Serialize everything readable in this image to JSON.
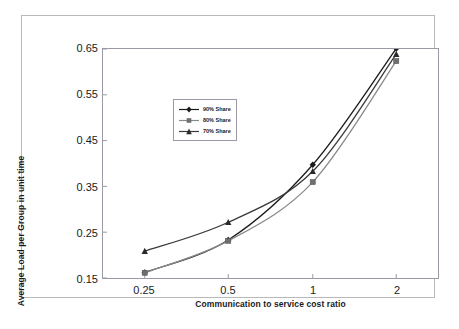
{
  "chart_data": {
    "type": "line",
    "title": "",
    "xlabel": "Communication to service cost ratio",
    "ylabel": "Average Load per Group in unit time",
    "categories": [
      "0.25",
      "0.5",
      "1",
      "2"
    ],
    "x_tick_labels": [
      "0.25",
      "0.5",
      "1",
      "2"
    ],
    "y_tick_labels": [
      "0.15",
      "0.25",
      "0.35",
      "0.45",
      "0.55",
      "0.65"
    ],
    "ylim": [
      0.15,
      0.68
    ],
    "grid": false,
    "legend_position": "upper-left-inside",
    "series": [
      {
        "name": "90% Share",
        "marker": "diamond",
        "color": "#1a1a1a",
        "values": [
          0.163,
          0.238,
          0.412,
          0.681
        ]
      },
      {
        "name": "80% Share",
        "marker": "square",
        "color": "#8a8a8a",
        "values": [
          0.162,
          0.236,
          0.372,
          0.652
        ]
      },
      {
        "name": "70% Share",
        "marker": "triangle",
        "color": "#3a3a3a",
        "values": [
          0.212,
          0.279,
          0.397,
          0.668
        ]
      }
    ]
  },
  "legend": {
    "entries": [
      {
        "label": "90% Share"
      },
      {
        "label": "80% Share"
      },
      {
        "label": "70% Share"
      }
    ]
  },
  "axes": {
    "x_label": "Communication to service cost ratio",
    "y_label": "Average Load per Group in unit time",
    "x_ticks": [
      "0.25",
      "0.5",
      "1",
      "2"
    ],
    "y_ticks": [
      "0.65",
      "0.55",
      "0.45",
      "0.35",
      "0.25",
      "0.15"
    ]
  }
}
